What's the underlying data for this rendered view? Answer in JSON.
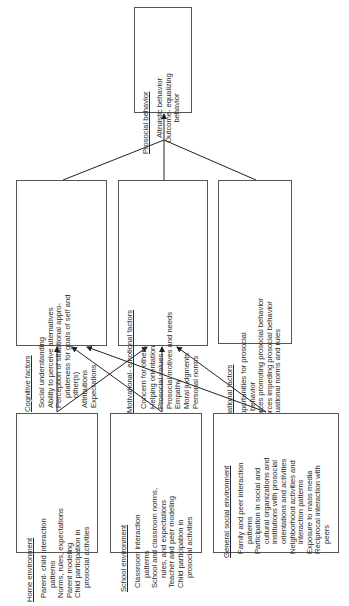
{
  "diagram": {
    "outcome": {
      "title": "Prosocial behavior",
      "items": [
        "Altruistic behavior",
        "Outcome- equalizing",
        "behavior"
      ]
    },
    "factors": [
      {
        "id": "cognitive",
        "title": "Cognitive factors",
        "items": [
          {
            "text": "Social understanding",
            "cont": false
          },
          {
            "text": "Ability to perceive alternatives",
            "cont": false
          },
          {
            "text": "Perception of situational appro-",
            "cont": false
          },
          {
            "text": "priateness for goals of self and",
            "cont": true
          },
          {
            "text": "other(s)",
            "cont": true
          },
          {
            "text": "Attributions",
            "cont": false
          },
          {
            "text": "Expectations",
            "cont": false
          }
        ]
      },
      {
        "id": "motivational",
        "title": "Motivational- emotional factors",
        "items": [
          {
            "text": "Concern for others",
            "cont": false
          },
          {
            "text": "Helping orientation",
            "cont": false
          },
          {
            "text": "Prosocial values",
            "cont": false
          },
          {
            "text": "Prosocial motives and needs",
            "cont": false
          },
          {
            "text": "Empathy",
            "cont": false
          },
          {
            "text": "Moral judgments",
            "cont": false
          },
          {
            "text": "Personal norms",
            "cont": false
          }
        ]
      },
      {
        "id": "situational",
        "title": "Situational factors",
        "items": [
          {
            "text": "Opportunities for prosocial",
            "cont": false
          },
          {
            "text": "behavior",
            "cont": true
          },
          {
            "text": "Forces promoting prosocial behavior",
            "cont": false
          },
          {
            "text": "Forces impeding prosocial behavior",
            "cont": false
          },
          {
            "text": "Situational norms and rules",
            "cont": false
          }
        ]
      }
    ],
    "environments": [
      {
        "id": "home",
        "title": "Home environment",
        "items": [
          {
            "text": "Parent- child interaction",
            "cont": false
          },
          {
            "text": "patterns",
            "cont": true
          },
          {
            "text": "Norms, rules, expectations",
            "cont": false
          },
          {
            "text": "Parent modeling",
            "cont": false
          },
          {
            "text": "Child participation in",
            "cont": false
          },
          {
            "text": "prosocial activities",
            "cont": true
          }
        ]
      },
      {
        "id": "school",
        "title": "School environment",
        "items": [
          {
            "text": "Classroom interaction",
            "cont": false
          },
          {
            "text": "patterns",
            "cont": true
          },
          {
            "text": "School and classroom norms,",
            "cont": false
          },
          {
            "text": "rules, and expectations",
            "cont": true
          },
          {
            "text": "Teacher and peer modeling",
            "cont": false
          },
          {
            "text": "Child participation in",
            "cont": false
          },
          {
            "text": "prosocial activities",
            "cont": true
          }
        ]
      },
      {
        "id": "general",
        "title": "General social environment",
        "items": [
          {
            "text": "Family and peer interaction",
            "cont": false
          },
          {
            "text": "patterns",
            "cont": true
          },
          {
            "text": "Participation in social and",
            "cont": false
          },
          {
            "text": "cultural organizations and",
            "cont": true
          },
          {
            "text": "institutions with prosocial",
            "cont": true
          },
          {
            "text": "orientations and activities",
            "cont": true
          },
          {
            "text": "Neighborhood activities and",
            "cont": false
          },
          {
            "text": "interaction patterns",
            "cont": true
          },
          {
            "text": "Exposure to mass media",
            "cont": false
          },
          {
            "text": "Reciprocal interaction with",
            "cont": false
          },
          {
            "text": "peers",
            "cont": true
          }
        ]
      }
    ]
  }
}
